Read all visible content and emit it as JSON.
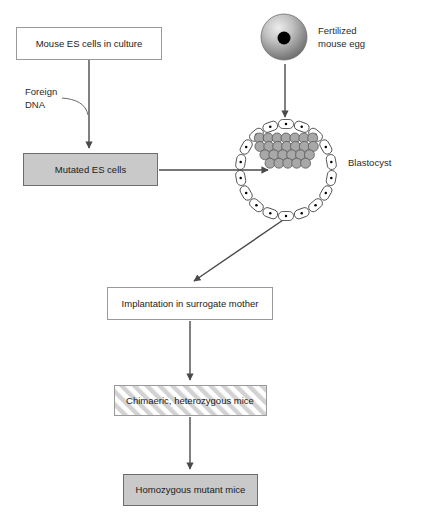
{
  "diagram": {
    "background_color": "#ffffff"
  },
  "boxes": [
    {
      "id": "mouse-es-cells",
      "label": "Mouse ES cells in culture",
      "style": "plain",
      "fill": "#ffffff",
      "stroke": "#9a9a9a",
      "x": 16,
      "y": 27,
      "width": 145,
      "height": 32
    },
    {
      "id": "mutated-es-cells",
      "label": "Mutated ES cells",
      "style": "gray",
      "fill": "#c9c9c9",
      "stroke": "#6d6d6d",
      "x": 23,
      "y": 153,
      "width": 134,
      "height": 32
    },
    {
      "id": "implantation",
      "label": "Implantation in surrogate mother",
      "style": "plain",
      "fill": "#ffffff",
      "stroke": "#9a9a9a",
      "x": 107,
      "y": 287,
      "width": 165,
      "height": 32
    },
    {
      "id": "chimaeric-mice",
      "label": "Chimaeric, heterozygous mice",
      "style": "hatched",
      "fill": "#ffffff",
      "stroke": "#9a9a9a",
      "x": 114,
      "y": 385,
      "width": 152,
      "height": 30
    },
    {
      "id": "homozygous-mice",
      "label": "Homozygous mutant mice",
      "style": "gray",
      "fill": "#c9c9c9",
      "stroke": "#6d6d6d",
      "x": 123,
      "y": 474,
      "width": 134,
      "height": 31
    }
  ],
  "labels": [
    {
      "id": "foreign-dna",
      "line1": "Foreign",
      "line2": "DNA",
      "x": 25,
      "y": 96
    },
    {
      "id": "fertilized-egg",
      "line1": "Fertilized",
      "line2": "mouse egg",
      "x": 318,
      "y": 33
    },
    {
      "id": "blastocyst",
      "line1": "Blastocyst",
      "line2": "",
      "x": 348,
      "y": 163
    }
  ],
  "structures": {
    "fertilized_egg": {
      "name": "fertilized-mouse-egg",
      "cx": 284,
      "cy": 37,
      "radius": 23,
      "nucleus_radius": 6.5,
      "nucleus_color": "#000000",
      "shell_light": "#e8e8e8",
      "shell_dark": "#7d7d7d"
    },
    "blastocyst": {
      "name": "blastocyst",
      "cx": 286,
      "cy": 170,
      "radius": 46,
      "trophoblast_cell_count": 18,
      "trophoblast_fill": "#ffffff",
      "inner_cell_mass_fill": "#a8a8a8",
      "inner_cell_mass_count": 25
    }
  },
  "arrows": [
    {
      "id": "es-cells-to-mutated",
      "from": "mouse-es-cells",
      "to": "mutated-es-cells",
      "direction": "down"
    },
    {
      "id": "foreign-dna-into-flow",
      "from": "foreign-dna",
      "to": "es-cells-to-mutated",
      "direction": "curve-right"
    },
    {
      "id": "egg-to-blastocyst",
      "from": "fertilized-egg",
      "to": "blastocyst",
      "direction": "down"
    },
    {
      "id": "mutated-into-blastocyst",
      "from": "mutated-es-cells",
      "to": "blastocyst",
      "direction": "right"
    },
    {
      "id": "blastocyst-to-implantation",
      "from": "blastocyst",
      "to": "implantation",
      "direction": "diagonal-down-left"
    },
    {
      "id": "implantation-to-chimaeric",
      "from": "implantation",
      "to": "chimaeric-mice",
      "direction": "down"
    },
    {
      "id": "chimaeric-to-homozygous",
      "from": "chimaeric-mice",
      "to": "homozygous-mice",
      "direction": "down"
    }
  ]
}
